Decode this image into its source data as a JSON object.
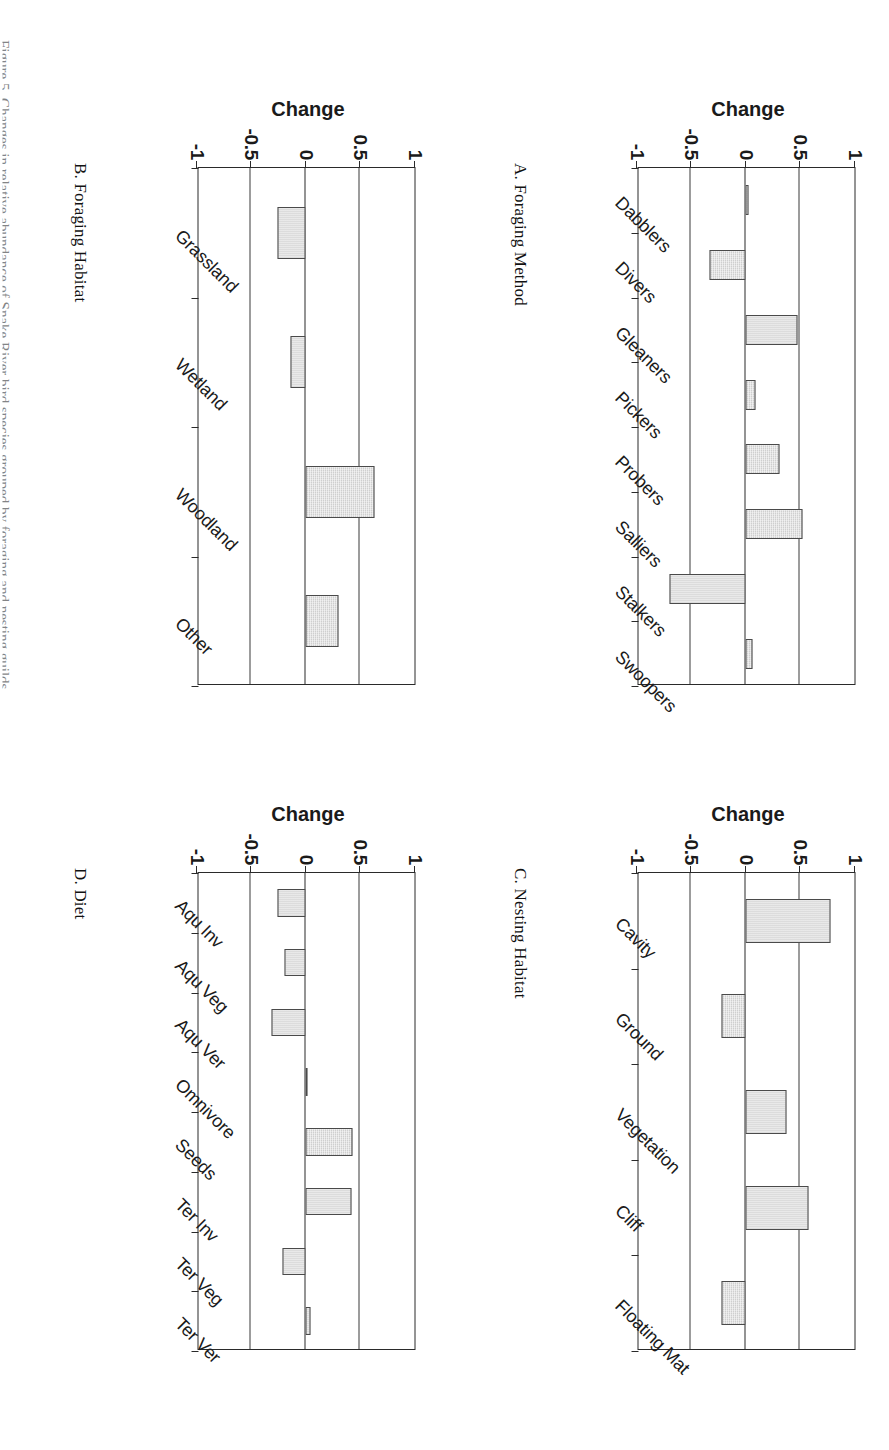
{
  "figure": {
    "page_caption": "Figure 5. Changes in relative abundance of Snake River bird species grouped by foraging and nesting guilds.",
    "y_axis_title": "Change",
    "y_ticks": [
      "1",
      "0.5",
      "0",
      "-0.5",
      "-1"
    ],
    "y_tick_values": [
      1,
      0.5,
      0,
      -0.5,
      -1
    ],
    "ylim": [
      -1,
      1
    ]
  },
  "chart_data": [
    {
      "type": "bar",
      "panel": "A",
      "title": "A. Foraging Method",
      "ylabel": "Change",
      "xlabel": "",
      "ylim": [
        -1,
        1
      ],
      "grid": true,
      "categories": [
        "Dabblers",
        "Divers",
        "Gleaners",
        "Pickers",
        "Probers",
        "Salliers",
        "Stalkers",
        "Swoopers"
      ],
      "values": [
        0.03,
        -0.33,
        0.48,
        0.09,
        0.31,
        0.52,
        -0.7,
        0.06
      ]
    },
    {
      "type": "bar",
      "panel": "B",
      "title": "B. Foraging Habitat",
      "ylabel": "Change",
      "xlabel": "",
      "ylim": [
        -1,
        1
      ],
      "grid": true,
      "categories": [
        "Grassland",
        "Wetland",
        "Woodland",
        "Other"
      ],
      "values": [
        -0.26,
        -0.14,
        0.63,
        0.3
      ]
    },
    {
      "type": "bar",
      "panel": "C",
      "title": "C. Nesting Habitat",
      "ylabel": "Change",
      "xlabel": "",
      "ylim": [
        -1,
        1
      ],
      "grid": true,
      "categories": [
        "Cavity",
        "Ground",
        "Vegetation",
        "Cliff",
        "Floating Mat"
      ],
      "values": [
        0.78,
        -0.22,
        0.38,
        0.58,
        -0.22
      ]
    },
    {
      "type": "bar",
      "panel": "D",
      "title": "D. Diet",
      "ylabel": "Change",
      "xlabel": "",
      "ylim": [
        -1,
        1
      ],
      "grid": true,
      "categories": [
        "Aqu Inv",
        "Aqu Veg",
        "Aqu Ver",
        "Omnivore",
        "Seeds",
        "Ter Inv",
        "Ter Veg",
        "Ter Ver"
      ],
      "values": [
        -0.26,
        -0.19,
        -0.31,
        0.02,
        0.43,
        0.42,
        -0.21,
        0.05
      ]
    }
  ]
}
